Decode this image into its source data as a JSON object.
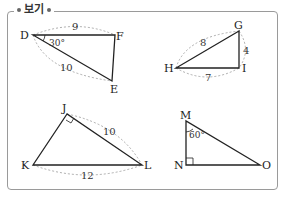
{
  "header": {
    "title": "보기"
  },
  "figures": [
    {
      "id": "DFE",
      "vertices": {
        "D": "D",
        "F": "F",
        "E": "E"
      },
      "sides": {
        "DF": "9",
        "DE": "10"
      },
      "angle": {
        "at": "D",
        "value": "30°"
      }
    },
    {
      "id": "GHI",
      "vertices": {
        "G": "G",
        "H": "H",
        "I": "I"
      },
      "sides": {
        "HG": "8",
        "GI": "4",
        "HI": "7"
      }
    },
    {
      "id": "JKL",
      "vertices": {
        "J": "J",
        "K": "K",
        "L": "L"
      },
      "sides": {
        "JL": "10",
        "KL": "12"
      },
      "right_angle": "J"
    },
    {
      "id": "MNO",
      "vertices": {
        "M": "M",
        "N": "N",
        "O": "O"
      },
      "angle": {
        "at": "M",
        "value": "60°"
      },
      "right_angle": "N"
    }
  ],
  "colors": {
    "line": "#222222",
    "dashed": "#999999",
    "frame": "#9a9a9a"
  }
}
